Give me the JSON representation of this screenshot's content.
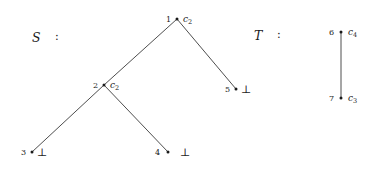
{
  "canvas": {
    "width": 385,
    "height": 175,
    "background": "#ffffff",
    "stroke_color": "#3a3a3a",
    "text_color": "#1a1a1a"
  },
  "structures": [
    {
      "id": "S",
      "label": "S",
      "colon": ":",
      "label_x": 32,
      "label_y": 30,
      "colon_x": 55,
      "colon_y": 30
    },
    {
      "id": "T",
      "label": "T",
      "colon": ":",
      "label_x": 254,
      "label_y": 28,
      "colon_x": 277,
      "colon_y": 28
    }
  ],
  "tree_s": {
    "name": "S",
    "nodes": [
      {
        "id": "n1",
        "index": "1",
        "value": "c",
        "subscript": "2",
        "kind": "internal",
        "x": 177,
        "y": 19,
        "index_dx": -6,
        "value_dx": 6
      },
      {
        "id": "n2",
        "index": "2",
        "value": "c",
        "subscript": "2",
        "kind": "internal",
        "x": 104,
        "y": 85,
        "index_dx": -6,
        "value_dx": 6
      },
      {
        "id": "n3",
        "index": "3",
        "value": "⊥",
        "subscript": "",
        "kind": "leaf",
        "x": 32,
        "y": 152,
        "index_dx": -6,
        "value_dx": 5
      },
      {
        "id": "n4",
        "index": "4",
        "value": "⊥",
        "subscript": "",
        "kind": "leaf",
        "x": 168,
        "y": 152,
        "index_dx": -8,
        "value_dx": 12
      },
      {
        "id": "n5",
        "index": "5",
        "value": "⊥",
        "subscript": "",
        "kind": "leaf",
        "x": 236,
        "y": 89,
        "index_dx": -6,
        "value_dx": 5
      }
    ],
    "edges": [
      {
        "from": "n1",
        "to": "n2",
        "x1": 177,
        "y1": 19,
        "x2": 104,
        "y2": 85
      },
      {
        "from": "n1",
        "to": "n5",
        "x1": 177,
        "y1": 19,
        "x2": 236,
        "y2": 89
      },
      {
        "from": "n2",
        "to": "n3",
        "x1": 104,
        "y1": 85,
        "x2": 32,
        "y2": 152
      },
      {
        "from": "n2",
        "to": "n4",
        "x1": 104,
        "y1": 85,
        "x2": 168,
        "y2": 152
      }
    ]
  },
  "tree_t": {
    "name": "T",
    "nodes": [
      {
        "id": "n6",
        "index": "6",
        "value": "c",
        "subscript": "4",
        "kind": "internal",
        "x": 341,
        "y": 32,
        "index_dx": -7,
        "value_dx": 7
      },
      {
        "id": "n7",
        "index": "7",
        "value": "c",
        "subscript": "3",
        "kind": "leaf",
        "x": 341,
        "y": 98,
        "index_dx": -7,
        "value_dx": 7
      }
    ],
    "edges": [
      {
        "from": "n6",
        "to": "n7",
        "x1": 341,
        "y1": 32,
        "x2": 341,
        "y2": 98
      }
    ]
  }
}
